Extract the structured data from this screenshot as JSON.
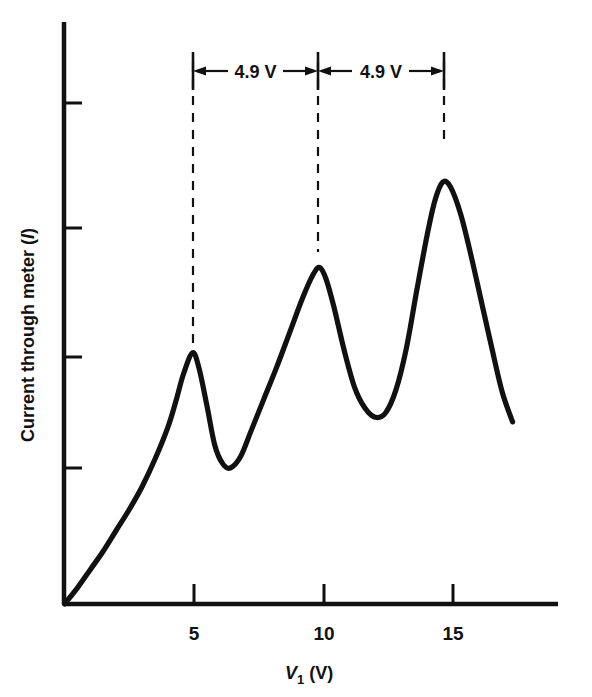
{
  "figure": {
    "kind": "franck-hertz-curve",
    "background_color": "#ffffff",
    "line_color": "#111111"
  },
  "axes": {
    "x": {
      "label_main": "V",
      "label_sub": "1",
      "label_unit": "(V)",
      "label_full": "V1 (V)",
      "tick_labels": [
        "5",
        "10",
        "15"
      ],
      "tick_values": [
        5,
        10,
        15
      ],
      "range": [
        0,
        17.5
      ],
      "grid": "off"
    },
    "y": {
      "label_text": "Current through meter (",
      "label_symbol": "I",
      "label_close": ")",
      "label_full": "Current through meter (I)",
      "tick_labels": [
        "",
        "",
        "",
        ""
      ],
      "tick_count": 4,
      "grid": "off"
    }
  },
  "annotations": {
    "spacing_label_1": "4.9 V",
    "spacing_label_2": "4.9 V",
    "marker_voltages": [
      4.95,
      9.85,
      14.6
    ],
    "dimension_value": 4.9,
    "dimension_unit": "V"
  },
  "chart_data": {
    "type": "line",
    "title": "",
    "xlabel": "V1 (V)",
    "ylabel": "Current through meter (I)",
    "xlim": [
      0,
      17.5
    ],
    "ylim": [
      0,
      1.05
    ],
    "grid": false,
    "legend": null,
    "series": [
      {
        "name": "Current through meter",
        "x": [
          0.0,
          0.5,
          1.0,
          1.5,
          2.0,
          2.5,
          3.0,
          3.5,
          4.0,
          4.3,
          4.6,
          4.95,
          5.2,
          5.5,
          5.8,
          6.1,
          6.4,
          6.8,
          7.2,
          7.7,
          8.2,
          8.7,
          9.2,
          9.6,
          9.85,
          10.1,
          10.4,
          10.8,
          11.2,
          11.6,
          12.0,
          12.4,
          12.8,
          13.2,
          13.6,
          14.0,
          14.3,
          14.6,
          14.9,
          15.3,
          15.7,
          16.1,
          16.5,
          16.9,
          17.3
        ],
        "y": [
          0.0,
          0.035,
          0.075,
          0.115,
          0.16,
          0.205,
          0.255,
          0.315,
          0.385,
          0.44,
          0.5,
          0.545,
          0.51,
          0.43,
          0.345,
          0.305,
          0.295,
          0.32,
          0.375,
          0.445,
          0.515,
          0.59,
          0.665,
          0.715,
          0.73,
          0.705,
          0.645,
          0.55,
          0.47,
          0.425,
          0.405,
          0.415,
          0.465,
          0.555,
          0.68,
          0.8,
          0.875,
          0.915,
          0.905,
          0.845,
          0.755,
          0.655,
          0.555,
          0.46,
          0.395
        ],
        "peaks": [
          {
            "x": 4.95,
            "y": 0.545
          },
          {
            "x": 9.85,
            "y": 0.73
          },
          {
            "x": 14.6,
            "y": 0.915
          }
        ],
        "valleys": [
          {
            "x": 6.35,
            "y": 0.295
          },
          {
            "x": 11.95,
            "y": 0.405
          }
        ]
      }
    ]
  }
}
